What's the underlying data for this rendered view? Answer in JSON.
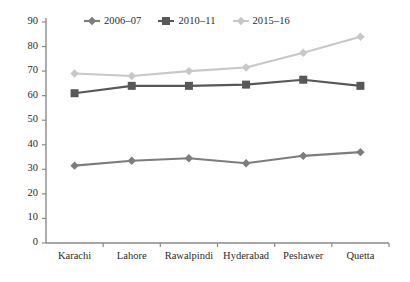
{
  "chart_data": {
    "type": "line",
    "title": "",
    "xlabel": "",
    "ylabel": "",
    "ylim": [
      0,
      90
    ],
    "ytick_step": 10,
    "yticks": [
      "0",
      "10",
      "20",
      "30",
      "40",
      "50",
      "60",
      "70",
      "80",
      "90"
    ],
    "grid": false,
    "legend_position": "top-center",
    "categories": [
      "Karachi",
      "Lahore",
      "Rawalpindi",
      "Hyderabad",
      "Peshawer",
      "Quetta"
    ],
    "series": [
      {
        "name": "2006–07",
        "color": "#7d7d7d",
        "marker": "diamond",
        "values": [
          31.5,
          33.5,
          34.5,
          32.5,
          35.5,
          37
        ]
      },
      {
        "name": "2010–11",
        "color": "#58585a",
        "marker": "square",
        "values": [
          61,
          64,
          64,
          64.5,
          66.5,
          64
        ]
      },
      {
        "name": "2015–16",
        "color": "#c8c8c8",
        "marker": "diamond",
        "values": [
          69,
          68,
          70,
          71.5,
          77.5,
          84
        ]
      }
    ]
  },
  "axis": {
    "line_color": "#8a8a8a"
  }
}
